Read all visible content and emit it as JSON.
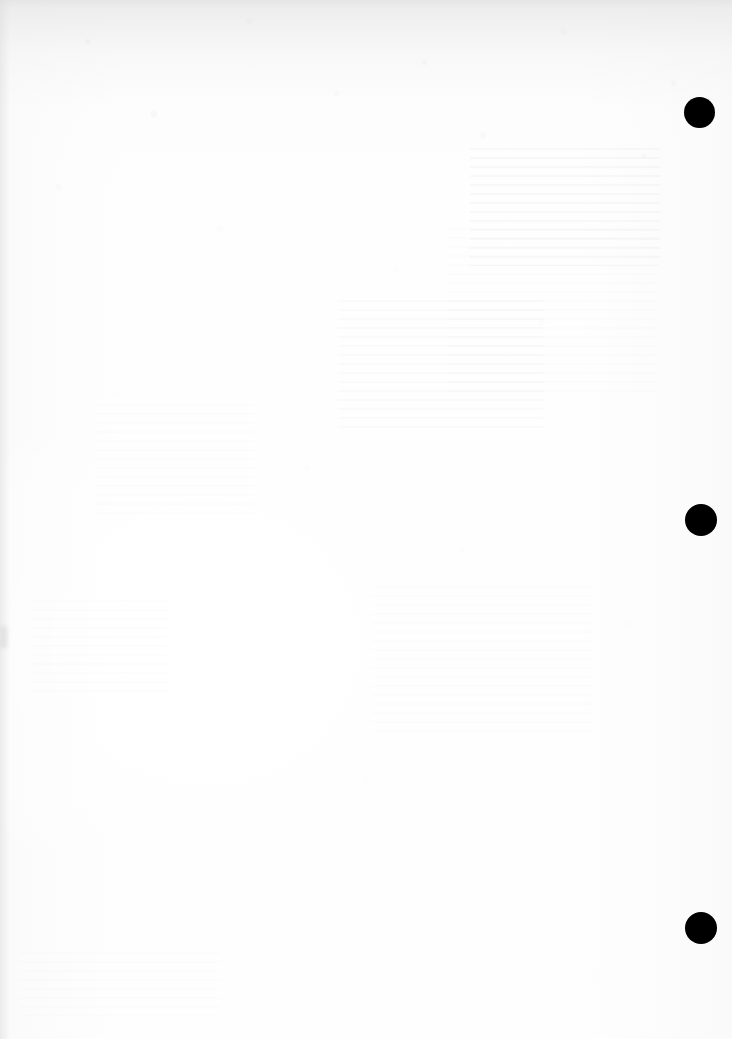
{
  "document": {
    "kind": "scanned-page",
    "page_state": "blank",
    "visible_text": "",
    "width_px": 732,
    "height_px": 1039,
    "background_color": "#ffffff",
    "paper_tone_color": "#fefefe",
    "ink_color": "#000000",
    "texture_color": "#e8e8e9",
    "ghost_color": "#e4e4e7"
  },
  "punch_holes": {
    "label": "binder punch holes",
    "count": 3,
    "color": "#000000",
    "edge": "right",
    "items": [
      {
        "name": "punch-hole-top",
        "cx": 699,
        "cy": 112,
        "d": 31
      },
      {
        "name": "punch-hole-middle",
        "cx": 701,
        "cy": 520,
        "d": 32
      },
      {
        "name": "punch-hole-bottom",
        "cx": 701,
        "cy": 928,
        "d": 32
      }
    ]
  },
  "show_through": {
    "label": "reverse-side bleed-through",
    "description": "faint mirrored text visible through the paper",
    "regions": [
      {
        "name": "ghost-upper-right",
        "x": 470,
        "y": 148,
        "w": 190,
        "h": 118,
        "level": "normal"
      },
      {
        "name": "ghost-upper-mid",
        "x": 338,
        "y": 300,
        "w": 205,
        "h": 132,
        "level": "faint"
      },
      {
        "name": "ghost-mid-right",
        "x": 448,
        "y": 228,
        "w": 210,
        "h": 170,
        "level": "fainter"
      },
      {
        "name": "ghost-centre",
        "x": 372,
        "y": 586,
        "w": 220,
        "h": 150,
        "level": "fainter"
      },
      {
        "name": "ghost-left-band",
        "x": 96,
        "y": 404,
        "w": 158,
        "h": 112,
        "level": "fainter"
      },
      {
        "name": "ghost-lower-left",
        "x": 30,
        "y": 600,
        "w": 140,
        "h": 96,
        "level": "fainter"
      },
      {
        "name": "ghost-bottom-band",
        "x": 20,
        "y": 952,
        "w": 200,
        "h": 64,
        "level": "fainter"
      }
    ]
  },
  "edge_marks": {
    "left_smudge": {
      "name": "left-edge-smudge",
      "x": 0,
      "y": 626,
      "w": 7,
      "h": 22
    }
  }
}
